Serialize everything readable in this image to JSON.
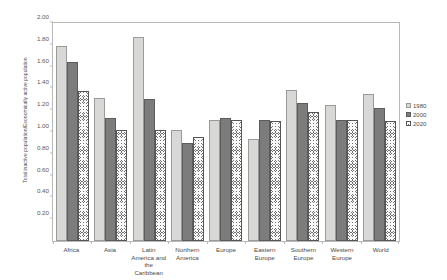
{
  "chart_data": {
    "type": "bar",
    "title": "",
    "xlabel": "",
    "ylabel": "Total inactive population/Economically active population",
    "ylim": [
      0.0,
      2.0
    ],
    "ytick_step": 0.2,
    "yticks": [
      "0.20",
      "0.40",
      "0.60",
      "0.80",
      "1.00",
      "1.20",
      "1.40",
      "1.60",
      "1.80",
      "2.00"
    ],
    "ytick_values": [
      0.2,
      0.4,
      0.6,
      0.8,
      1.0,
      1.2,
      1.4,
      1.6,
      1.8,
      2.0
    ],
    "grid": false,
    "legend_position": "right",
    "categories": [
      "Africa",
      "Asia",
      "Latin America and the Caribbean",
      "Northern America",
      "Europe",
      "Eastern Europe",
      "Southern Europe",
      "Western Europe",
      "World"
    ],
    "category_lines": [
      [
        "Africa"
      ],
      [
        "Asia"
      ],
      [
        "Latin",
        "America and",
        "the",
        "Caribbean"
      ],
      [
        "Northern",
        "America"
      ],
      [
        "Europe"
      ],
      [
        "Eastern",
        "Europe"
      ],
      [
        "Southern",
        "Europe"
      ],
      [
        "Western",
        "Europe"
      ],
      [
        "World"
      ]
    ],
    "series": [
      {
        "name": "1980",
        "values": [
          1.79,
          1.31,
          1.87,
          1.02,
          1.11,
          0.94,
          1.39,
          1.25,
          1.35
        ]
      },
      {
        "name": "2000",
        "values": [
          1.64,
          1.13,
          1.3,
          0.9,
          1.13,
          1.11,
          1.27,
          1.11,
          1.22
        ]
      },
      {
        "name": "2020",
        "values": [
          1.38,
          1.02,
          1.02,
          0.95,
          1.11,
          1.1,
          1.18,
          1.11,
          1.1
        ]
      }
    ]
  },
  "legend": {
    "items": [
      {
        "label": "1980",
        "swatch": "light-gray-square"
      },
      {
        "label": "2000",
        "swatch": "dark-gray-square"
      },
      {
        "label": "2020",
        "swatch": "hatched-square"
      }
    ]
  },
  "colors": {
    "series_1980": "#d8d8d6",
    "series_2000": "#7c7c7c",
    "series_2020": "#6f6f6f",
    "frame": "#b9b9b9",
    "text": "#4a4a4a",
    "background": "#ffffff"
  }
}
